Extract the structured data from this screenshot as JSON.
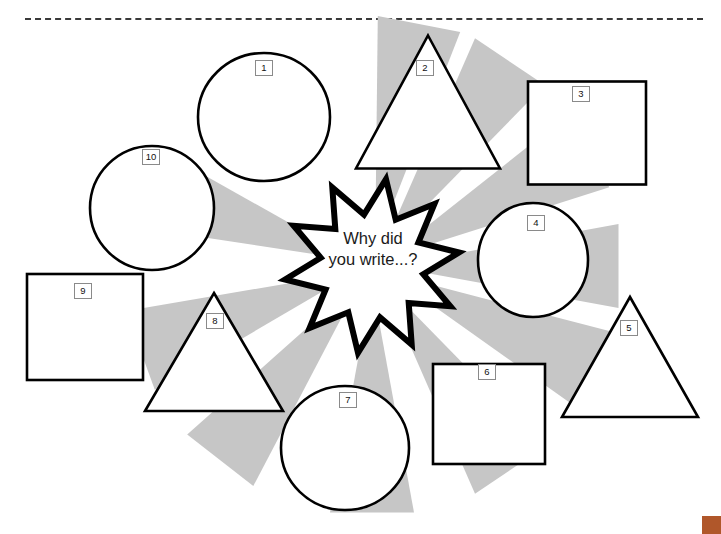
{
  "page": {
    "width": 721,
    "height": 534,
    "background": "#ffffff",
    "divider_style": "dashed",
    "divider_color": "#3a3a3a",
    "corner_mark_color": "#b0572a"
  },
  "diagram": {
    "type": "radial-starburst-worksheet",
    "center": {
      "shape": "starburst",
      "points": 10,
      "text": "Why did\nyou write...?",
      "cx": 372,
      "cy": 266,
      "outer_radius": 88,
      "inner_radius": 52,
      "stroke": "#000000",
      "stroke_width": 6,
      "fill": "#ffffff"
    },
    "ray": {
      "color": "#c6c6c6",
      "count": 10,
      "inner_radius": 30,
      "outer_radius": 250,
      "half_width_deg": 4.6
    },
    "shapes": [
      {
        "label": "1",
        "kind": "circle",
        "cx": 264,
        "cy": 117,
        "rx": 66,
        "ry": 64,
        "label_x": 255,
        "label_y": 60,
        "ray_angle": -79
      },
      {
        "label": "2",
        "kind": "triangle",
        "cx": 428,
        "cy": 102,
        "half_width": 72,
        "height": 133,
        "label_x": 416,
        "label_y": 60,
        "ray_angle": -56
      },
      {
        "label": "3",
        "kind": "square",
        "cx": 587,
        "cy": 133,
        "width": 118,
        "height": 103,
        "label_x": 572,
        "label_y": 86,
        "ray_angle": -28
      },
      {
        "label": "4",
        "kind": "circle",
        "cx": 533,
        "cy": 260,
        "rx": 55,
        "ry": 57,
        "label_x": 527,
        "label_y": 215,
        "ray_angle": 0
      },
      {
        "label": "5",
        "kind": "triangle",
        "cx": 630,
        "cy": 357,
        "half_width": 68,
        "height": 120,
        "label_x": 620,
        "label_y": 320,
        "ray_angle": 25
      },
      {
        "label": "6",
        "kind": "square",
        "cx": 489,
        "cy": 414,
        "width": 112,
        "height": 100,
        "label_x": 478,
        "label_y": 364,
        "ray_angle": 56
      },
      {
        "label": "7",
        "kind": "circle",
        "cx": 345,
        "cy": 448,
        "rx": 64,
        "ry": 62,
        "label_x": 339,
        "label_y": 392,
        "ray_angle": 90
      },
      {
        "label": "8",
        "kind": "triangle",
        "cx": 214,
        "cy": 352,
        "half_width": 69,
        "height": 118,
        "label_x": 206,
        "label_y": 313,
        "ray_angle": 128
      },
      {
        "label": "9",
        "kind": "square",
        "cx": 85,
        "cy": 327,
        "width": 116,
        "height": 106,
        "label_x": 74,
        "label_y": 283,
        "ray_angle": 160
      },
      {
        "label": "10",
        "kind": "circle",
        "cx": 152,
        "cy": 208,
        "rx": 62,
        "ry": 62,
        "label_x": 142,
        "label_y": 149,
        "ray_angle": -161
      }
    ]
  }
}
